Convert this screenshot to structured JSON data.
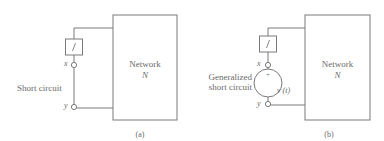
{
  "figure": {
    "panel_a": {
      "caption": "(a)",
      "network_label": "Network",
      "network_symbol": "N",
      "element_label": "i",
      "terminal_x": "x",
      "terminal_y": "y",
      "connection_label": "Short circuit"
    },
    "panel_b": {
      "caption": "(b)",
      "network_label": "Network",
      "network_symbol": "N",
      "element_label": "i",
      "terminal_x": "x",
      "terminal_y": "y",
      "connection_label_line1": "Generalized",
      "connection_label_line2": "short circuit",
      "source_polarity": "+",
      "source_label": "v (t)"
    },
    "colors": {
      "stroke": "#7a7a7a",
      "text": "#6a6a6a",
      "background": "#ffffff"
    }
  }
}
